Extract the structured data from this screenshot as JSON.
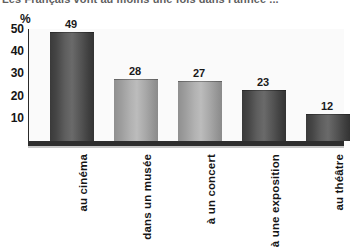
{
  "figure": {
    "title": "Les Français vont au moins une fois dans l'année ...",
    "unit_label": "%"
  },
  "chart_data": {
    "type": "bar",
    "title": "Les Français vont au moins une fois dans l'année ...",
    "xlabel": "",
    "ylabel": "%",
    "ylim": [
      0,
      55
    ],
    "yticks": [
      10,
      20,
      30,
      40,
      50
    ],
    "grid": false,
    "legend": null,
    "categories": [
      "au cinéma",
      "dans un musée",
      "à un concert",
      "à une exposition",
      "au théâtre"
    ],
    "values": [
      49,
      28,
      27,
      23,
      12
    ],
    "bar_shades": [
      "dark",
      "light",
      "light",
      "dark",
      "dark"
    ],
    "data_labels": [
      "49",
      "28",
      "27",
      "23",
      "12"
    ]
  }
}
